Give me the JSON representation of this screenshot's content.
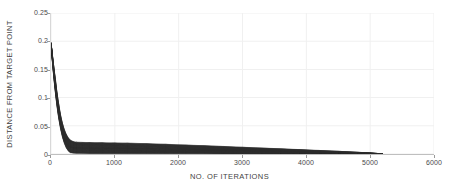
{
  "chart_data": {
    "type": "line",
    "title": "",
    "xlabel": "NO. OF ITERATIONS",
    "ylabel": "DISTANCE FROM TARGET POINT",
    "xlim": [
      0,
      6000
    ],
    "ylim": [
      0,
      0.25
    ],
    "xticks": [
      0,
      1000,
      2000,
      3000,
      4000,
      5000,
      6000
    ],
    "xticklabels": [
      "0",
      "1000",
      "2000",
      "3000",
      "4000",
      "5000",
      "6000"
    ],
    "yticks": [
      0,
      0.05,
      0.1,
      0.15,
      0.2,
      0.25
    ],
    "yticklabels": [
      "0",
      "0.05",
      "0.1",
      "0.15",
      "0.2",
      "0.25"
    ],
    "grid": true,
    "grid_color": "#f0f0f0",
    "legend": "none",
    "series_color": "#2b2b2b",
    "band_upper": {
      "name": "upper envelope",
      "x": [
        0,
        20,
        40,
        60,
        80,
        100,
        120,
        150,
        180,
        210,
        240,
        270,
        300,
        350,
        400,
        500,
        600,
        800,
        1000,
        1200,
        1500,
        1800,
        2100,
        2400,
        2700,
        3000,
        3300,
        3600,
        3900,
        4200,
        4500,
        4800,
        5000,
        5100,
        5200
      ],
      "values": [
        0.197,
        0.178,
        0.158,
        0.139,
        0.121,
        0.104,
        0.089,
        0.069,
        0.054,
        0.043,
        0.035,
        0.029,
        0.025,
        0.022,
        0.021,
        0.0205,
        0.0203,
        0.02,
        0.0197,
        0.0192,
        0.0183,
        0.0172,
        0.016,
        0.0147,
        0.0134,
        0.012,
        0.0106,
        0.0092,
        0.0078,
        0.0063,
        0.0048,
        0.0031,
        0.0019,
        0.0011,
        0.0
      ]
    },
    "band_lower": {
      "name": "lower envelope",
      "x": [
        0,
        20,
        40,
        60,
        80,
        100,
        120,
        150,
        180,
        210,
        240,
        270,
        300,
        350,
        400,
        500,
        600,
        800,
        1000,
        1200,
        1500,
        1800,
        2100,
        2400,
        2700,
        3000,
        3300,
        3600,
        3900,
        4200,
        4500,
        4800,
        5000,
        5100,
        5200
      ],
      "values": [
        0.197,
        0.166,
        0.14,
        0.117,
        0.097,
        0.079,
        0.063,
        0.044,
        0.029,
        0.018,
        0.01,
        0.005,
        0.002,
        0.0012,
        0.0009,
        0.0007,
        0.0006,
        0.0005,
        0.0005,
        0.0004,
        0.0004,
        0.0003,
        0.0003,
        0.0003,
        0.0002,
        0.0002,
        0.0002,
        0.0002,
        0.0001,
        0.0001,
        0.0001,
        0.0001,
        0.0001,
        0.0,
        0.0
      ]
    },
    "series": [
      {
        "name": "median trace",
        "x": [
          0,
          25,
          50,
          75,
          100,
          125,
          150,
          175,
          200,
          225,
          250,
          275,
          300,
          350,
          400,
          500,
          700,
          900,
          1100,
          1400,
          1700,
          2000,
          2300,
          2600,
          2900,
          3200,
          3500,
          3800,
          4100,
          4400,
          4700,
          5000,
          5200
        ],
        "values": [
          0.197,
          0.172,
          0.149,
          0.128,
          0.092,
          0.074,
          0.057,
          0.042,
          0.03,
          0.022,
          0.017,
          0.014,
          0.012,
          0.011,
          0.0108,
          0.0106,
          0.0104,
          0.0102,
          0.01,
          0.0096,
          0.0091,
          0.0085,
          0.0079,
          0.0072,
          0.0065,
          0.0057,
          0.0049,
          0.0041,
          0.0033,
          0.0025,
          0.0016,
          0.0008,
          0.0
        ]
      }
    ]
  }
}
